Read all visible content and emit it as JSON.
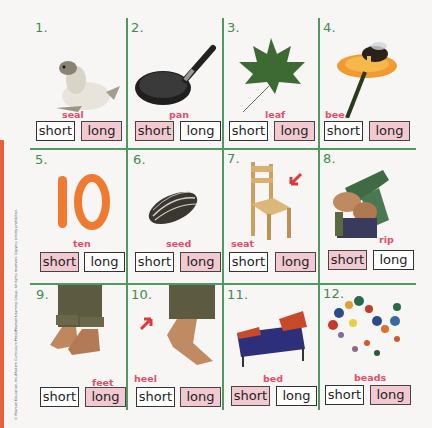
{
  "copyright": "© Pearson Education, Inc./Modern Curriculum Press/Pearson Learning Group. All rights reserved. Copying strictly prohibited.",
  "colors": {
    "grid_line": "#4e9a62",
    "number": "#3f8a55",
    "word_label": "#e0506a",
    "selected_fill": "#f2c9d1",
    "edge_stripe": "#e8603c"
  },
  "options": {
    "short": "short",
    "long": "long"
  },
  "items": [
    {
      "number": "1.",
      "word": "seal",
      "image": "seal",
      "selected": "long"
    },
    {
      "number": "2.",
      "word": "pan",
      "image": "frying-pan",
      "selected": "short"
    },
    {
      "number": "3.",
      "word": "leaf",
      "image": "maple-leaf",
      "selected": "long"
    },
    {
      "number": "4.",
      "word": "bee",
      "image": "bee-on-flower",
      "selected": "long"
    },
    {
      "number": "5.",
      "word": "ten",
      "image": "number-ten",
      "selected": "short"
    },
    {
      "number": "6.",
      "word": "seed",
      "image": "sunflower-seed",
      "selected": "long"
    },
    {
      "number": "7.",
      "word": "seat",
      "image": "wooden-chair-with-arrow",
      "selected": "long"
    },
    {
      "number": "8.",
      "word": "rip",
      "image": "hands-ripping-paper",
      "selected": "short"
    },
    {
      "number": "9.",
      "word": "feet",
      "image": "bare-feet",
      "selected": "long"
    },
    {
      "number": "10.",
      "word": "heel",
      "image": "foot-heel-with-arrow",
      "selected": "long"
    },
    {
      "number": "11.",
      "word": "bed",
      "image": "bed",
      "selected": "short"
    },
    {
      "number": "12.",
      "word": "beads",
      "image": "string-of-beads",
      "selected": "long"
    }
  ]
}
